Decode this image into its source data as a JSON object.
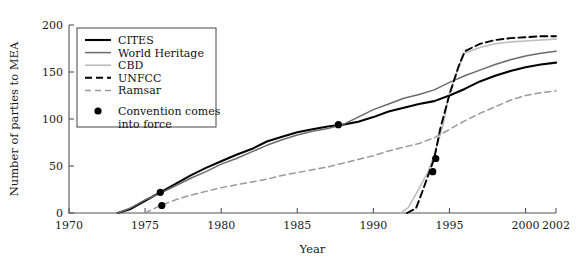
{
  "chart_data": {
    "type": "line",
    "title": "",
    "xlabel": "Year",
    "ylabel": "Number of parties to MEA",
    "xlim": [
      1970,
      2002
    ],
    "ylim": [
      0,
      200
    ],
    "xticks": [
      1970,
      1975,
      1980,
      1985,
      1990,
      1995,
      2000,
      2002
    ],
    "xtick_labels": [
      "1970",
      "1975",
      "1980",
      "1985",
      "1990",
      "1995",
      "2000",
      "2002"
    ],
    "yticks": [
      0,
      50,
      100,
      150,
      200
    ],
    "ytick_labels": [
      "0",
      "50",
      "100",
      "150",
      "200"
    ],
    "grid": false,
    "legend_position": "upper-left-inset",
    "series": [
      {
        "name": "CITES",
        "style": "solid",
        "color": "#000000",
        "width": 2.1,
        "x": [
          1973.2,
          1974,
          1975,
          1976,
          1977,
          1978,
          1979,
          1980,
          1981,
          1982,
          1983,
          1984,
          1985,
          1986,
          1987,
          1988,
          1989,
          1990,
          1991,
          1992,
          1993,
          1994,
          1995,
          1996,
          1997,
          1998,
          1999,
          2000,
          2001,
          2002
        ],
        "y": [
          0,
          4,
          13,
          22,
          31,
          40,
          48,
          55,
          62,
          68,
          76,
          81,
          86,
          89,
          92,
          94,
          97,
          102,
          108,
          112,
          116,
          119,
          125,
          132,
          140,
          146,
          151,
          155,
          158,
          160
        ]
      },
      {
        "name": "World Heritage",
        "style": "solid",
        "color": "#6b6b6b",
        "width": 1.5,
        "x": [
          1973.2,
          1974,
          1975,
          1976,
          1977,
          1978,
          1979,
          1980,
          1981,
          1982,
          1983,
          1984,
          1985,
          1986,
          1987,
          1988,
          1989,
          1990,
          1991,
          1992,
          1993,
          1994,
          1995,
          1996,
          1997,
          1998,
          1999,
          2000,
          2001,
          2002
        ],
        "y": [
          0,
          5,
          14,
          21,
          29,
          37,
          44,
          52,
          58,
          65,
          72,
          78,
          83,
          87,
          90,
          94,
          102,
          110,
          116,
          122,
          126,
          131,
          139,
          146,
          152,
          158,
          163,
          167,
          170,
          172
        ]
      },
      {
        "name": "CBD",
        "style": "solid",
        "color": "#bdbdbd",
        "width": 1.6,
        "x": [
          1991.8,
          1992.3,
          1993,
          1993.6,
          1994,
          1994.6,
          1995,
          1995.6,
          1996,
          1997,
          1998,
          1999,
          2000,
          2001,
          2002
        ],
        "y": [
          0,
          6,
          26,
          44,
          62,
          95,
          128,
          155,
          170,
          176,
          180,
          182,
          183,
          184,
          185
        ]
      },
      {
        "name": "UNFCC",
        "style": "dashed",
        "color": "#000000",
        "width": 1.9,
        "x": [
          1992.2,
          1992.8,
          1993.2,
          1993.6,
          1994,
          1994.4,
          1995,
          1995.6,
          1996,
          1997,
          1998,
          1999,
          2000,
          2001,
          2002
        ],
        "y": [
          0,
          5,
          22,
          40,
          58,
          90,
          126,
          156,
          172,
          180,
          184,
          186,
          187,
          188,
          188
        ]
      },
      {
        "name": "Ramsar",
        "style": "dashed",
        "color": "#9a9a9a",
        "width": 1.5,
        "x": [
          1975,
          1976,
          1977,
          1978,
          1979,
          1980,
          1981,
          1982,
          1983,
          1984,
          1985,
          1986,
          1987,
          1988,
          1989,
          1990,
          1991,
          1992,
          1993,
          1994,
          1995,
          1996,
          1997,
          1998,
          1999,
          2000,
          2001,
          2002
        ],
        "y": [
          0,
          8,
          14,
          19,
          23,
          27,
          30,
          33,
          36,
          40,
          43,
          46,
          49,
          53,
          57,
          61,
          66,
          70,
          74,
          80,
          89,
          98,
          106,
          113,
          120,
          125,
          128,
          130
        ]
      }
    ],
    "markers": {
      "label": "Convention comes into force",
      "points": [
        {
          "series": "CITES",
          "x": 1976.0,
          "y": 22
        },
        {
          "series": "Ramsar",
          "x": 1976.1,
          "y": 8
        },
        {
          "series": "World Heritage",
          "x": 1987.7,
          "y": 94
        },
        {
          "series": "UNFCC",
          "x": 1994.1,
          "y": 58
        },
        {
          "series": "CBD",
          "x": 1993.9,
          "y": 44
        }
      ]
    }
  },
  "legend": {
    "entries": [
      {
        "label": "CITES"
      },
      {
        "label": "World Heritage"
      },
      {
        "label": "CBD"
      },
      {
        "label": "UNFCC"
      },
      {
        "label": "Ramsar"
      }
    ],
    "marker_label_line1": "Convention comes",
    "marker_label_line2": "into force"
  }
}
